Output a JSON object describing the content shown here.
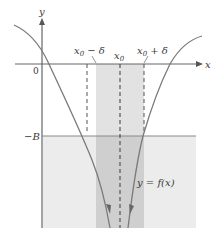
{
  "figure": {
    "axes": {
      "x_label": "x",
      "y_label": "y",
      "origin_label": "0"
    },
    "labels": {
      "x0_minus_delta": "x",
      "x0_minus_delta_sub": "0",
      "x0_minus_delta_rest": " − δ",
      "x0": "x",
      "x0_sub": "0",
      "x0_plus_delta": "x",
      "x0_plus_delta_sub": "0",
      "x0_plus_delta_rest": " + δ",
      "neg_B": "−B",
      "function": "y = f(x)"
    },
    "colors": {
      "curve": "#7a7a7a",
      "axis": "#555555",
      "light_shade": "#ececec",
      "band_shade": "#dcdcdc",
      "overlap_shade": "#c6c6c6",
      "dashed": "#555555"
    }
  }
}
